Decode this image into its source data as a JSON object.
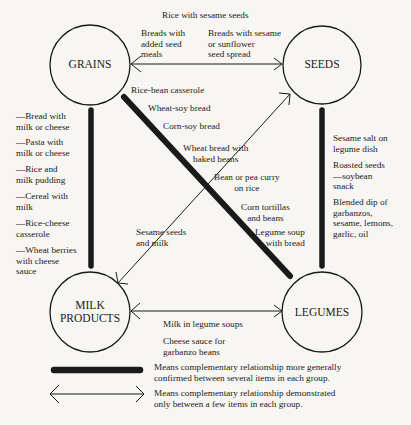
{
  "nodes": {
    "grains": {
      "label": "GRAINS"
    },
    "seeds": {
      "label": "SEEDS"
    },
    "milk": {
      "label_line1": "MILK",
      "label_line2": "PRODUCTS"
    },
    "legumes": {
      "label": "LEGUMES"
    }
  },
  "edges": {
    "grains_seeds": {
      "type": "thin-double-arrow",
      "top_label": "Rice with sesame seeds",
      "left_label": [
        "Breads with",
        "added seed",
        "meals"
      ],
      "right_label": [
        "Breads with sesame",
        "or sunflower",
        "seed spread"
      ]
    },
    "grains_legumes": {
      "type": "thick",
      "labels": [
        "Rice-bean casserole",
        "Wheat-soy bread",
        "Corn-soy bread",
        [
          "Wheat bread with",
          "baked beans"
        ],
        [
          "Bean or pea curry",
          "on rice"
        ],
        [
          "Corn tortillas",
          "and beans"
        ],
        [
          "Legume soup",
          "with bread"
        ]
      ]
    },
    "milk_seeds": {
      "type": "thin-double-arrow",
      "labels": [
        [
          "Sesame seeds",
          "and milk"
        ]
      ]
    },
    "grains_milk": {
      "type": "thick",
      "labels": [
        [
          "—Bread with",
          "milk or cheese"
        ],
        [
          "—Pasta with",
          "milk or cheese"
        ],
        [
          "—Rice and",
          "milk pudding"
        ],
        [
          "—Cereal with",
          "milk"
        ],
        [
          "—Rice-cheese",
          "casserole"
        ],
        [
          "—Wheat berries",
          "with cheese",
          "sauce"
        ]
      ]
    },
    "seeds_legumes": {
      "type": "thick",
      "labels": [
        [
          "Sesame salt on",
          "legume dish"
        ],
        [
          "Roasted seeds",
          "—soybean",
          "snack"
        ],
        [
          "Blended dip of",
          "garbanzos,",
          "sesame, lemons,",
          "garlic, oil"
        ]
      ]
    },
    "milk_legumes": {
      "type": "thin-double-arrow",
      "labels": [
        "Milk in legume soups",
        [
          "Cheese sauce for",
          "garbanzo beans"
        ]
      ]
    }
  },
  "legend": {
    "thick": [
      "Means complementary relationship more generally",
      "confirmed between several items in each group."
    ],
    "thin": [
      "Means complementary relationship demonstrated",
      "only between a few items in each group."
    ]
  },
  "colors": {
    "ink": "#1a1a1a",
    "paper": "#f7f6f3"
  }
}
